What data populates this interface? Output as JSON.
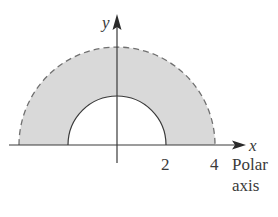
{
  "diagram": {
    "type": "polar-region",
    "axes": {
      "x_label": "x",
      "y_label": "y",
      "polar_axis_label_line1": "Polar",
      "polar_axis_label_line2": "axis"
    },
    "ticks": [
      {
        "value": 2,
        "label": "2"
      },
      {
        "value": 4,
        "label": "4"
      }
    ],
    "region": {
      "inner_radius": 2,
      "outer_radius": 4,
      "inner_boundary_style": "solid",
      "outer_boundary_style": "dashed",
      "theta_min": "0",
      "theta_max": "pi"
    },
    "colors": {
      "fill": "#d9d9d9",
      "stroke": "#3a3a3a",
      "outer_dashed": "#6e6e6e"
    }
  }
}
